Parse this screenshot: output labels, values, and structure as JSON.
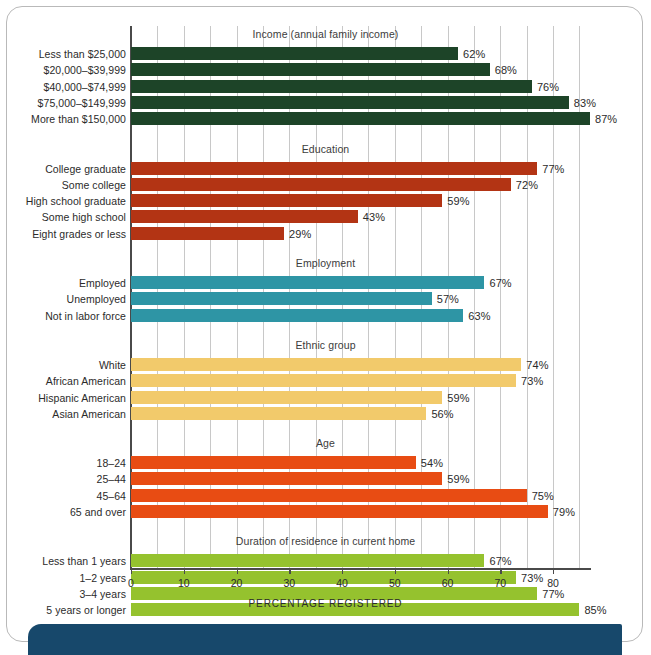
{
  "chart_data": {
    "type": "bar",
    "title": "",
    "xlabel": "PERCENTAGE REGISTERED",
    "ylabel": "",
    "xlim": [
      0,
      90
    ],
    "xticks": [
      0,
      10,
      20,
      30,
      40,
      50,
      60,
      70,
      80
    ],
    "gridlines_every": 5,
    "grid": true,
    "legend": "none",
    "orientation": "horizontal",
    "value_suffix": "%",
    "groups": [
      {
        "name": "Income (annual family income)",
        "color": "#1d4428",
        "categories": [
          "Less than $25,000",
          "$20,000–$39,999",
          "$40,000–$74,999",
          "$75,000–$149,999",
          "More than $150,000"
        ],
        "values": [
          62,
          68,
          76,
          83,
          87
        ],
        "labels": [
          "62%",
          "68%",
          "76%",
          "83%",
          "87%"
        ]
      },
      {
        "name": "Education",
        "color": "#b33414",
        "categories": [
          "College graduate",
          "Some college",
          "High school graduate",
          "Some high school",
          "Eight grades or less"
        ],
        "values": [
          77,
          72,
          59,
          43,
          29
        ],
        "labels": [
          "77%",
          "72%",
          "59%",
          "43%",
          "29%"
        ]
      },
      {
        "name": "Employment",
        "color": "#2e95a5",
        "categories": [
          "Employed",
          "Unemployed",
          "Not in labor force"
        ],
        "values": [
          67,
          57,
          63
        ],
        "labels": [
          "67%",
          "57%",
          "63%"
        ]
      },
      {
        "name": "Ethnic group",
        "color": "#f2ca6b",
        "categories": [
          "White",
          "African American",
          "Hispanic American",
          "Asian American"
        ],
        "values": [
          74,
          73,
          59,
          56
        ],
        "labels": [
          "74%",
          "73%",
          "59%",
          "56%"
        ]
      },
      {
        "name": "Age",
        "color": "#e84c13",
        "categories": [
          "18–24",
          "25–44",
          "45–64",
          "65 and over"
        ],
        "values": [
          54,
          59,
          75,
          79
        ],
        "labels": [
          "54%",
          "59%",
          "75%",
          "79%"
        ]
      },
      {
        "name": "Duration of residence in current home",
        "color": "#95c22e",
        "categories": [
          "Less than 1 years",
          "1–2 years",
          "3–4 years",
          "5 years or longer"
        ],
        "values": [
          67,
          73,
          77,
          85
        ],
        "labels": [
          "67%",
          "73%",
          "77%",
          "85%"
        ]
      }
    ]
  },
  "colors": {
    "frame_border": "#b9b9b9",
    "banner": "#17486b",
    "axis": "#4a4a4a",
    "gridline": "#c8c8c8",
    "text": "#2b2b2b"
  }
}
